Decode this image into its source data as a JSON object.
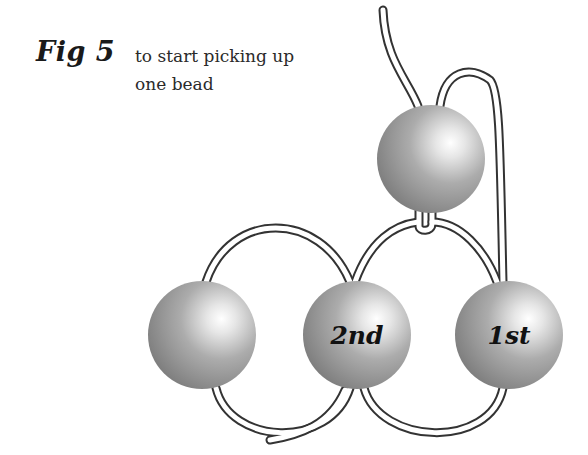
{
  "figure": {
    "label": "Fig 5",
    "caption_line1": "to start picking up",
    "caption_line2": "one bead"
  },
  "beads": [
    {
      "id": "top",
      "label": "",
      "cx": 431,
      "cy": 159,
      "r": 54
    },
    {
      "id": "left",
      "label": "",
      "cx": 202,
      "cy": 335,
      "r": 54
    },
    {
      "id": "second",
      "label": "2nd",
      "cx": 357,
      "cy": 335,
      "r": 54
    },
    {
      "id": "first",
      "label": "1st",
      "cx": 509,
      "cy": 335,
      "r": 54
    }
  ],
  "colors": {
    "bead_dark": "#7a7a7a",
    "bead_mid": "#a8a8a8",
    "bead_highlight": "#ffffff",
    "thread_outline": "#333333",
    "thread_fill": "#ffffff"
  }
}
